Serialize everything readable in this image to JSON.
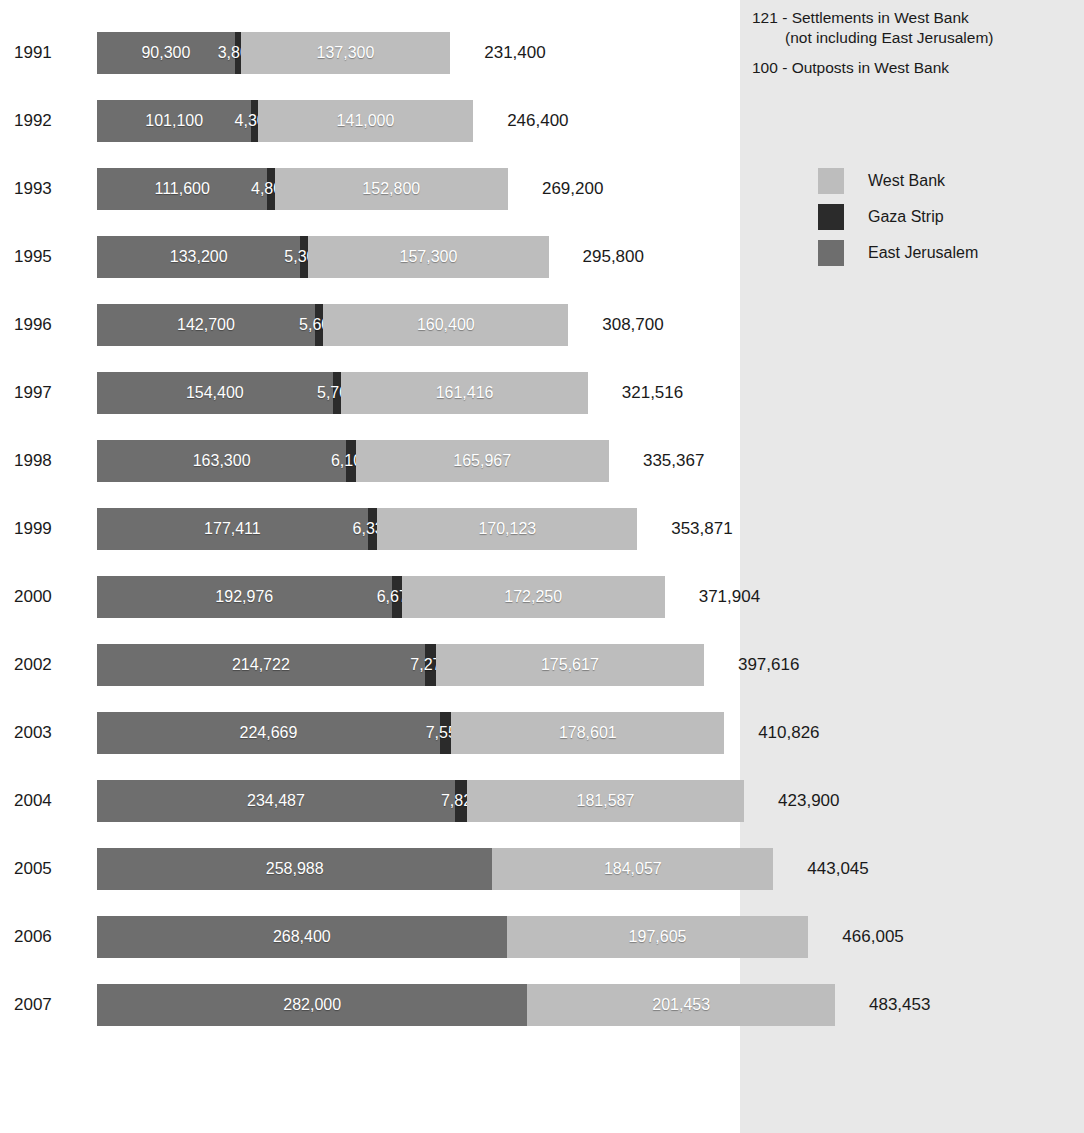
{
  "notes": {
    "line1": "121 - Settlements in West Bank",
    "line2": "(not including East Jerusalem)",
    "line3": "100 - Outposts in West Bank"
  },
  "legend": {
    "items": [
      {
        "label": "West Bank",
        "color": "#bdbdbd",
        "key": "west_bank"
      },
      {
        "label": "Gaza Strip",
        "color": "#2b2b2b",
        "key": "gaza_strip"
      },
      {
        "label": "East Jerusalem",
        "color": "#6e6e6e",
        "key": "east_jerusalem"
      }
    ]
  },
  "chart_data": {
    "type": "bar",
    "title": "",
    "subtitle": "",
    "xlabel": "",
    "ylabel": "",
    "orientation": "horizontal",
    "stacked": true,
    "grid": false,
    "legend_position": "right",
    "axis_visible": false,
    "xlim": [
      0,
      483453
    ],
    "categories": [
      "1991",
      "1992",
      "1993",
      "1995",
      "1996",
      "1997",
      "1998",
      "1999",
      "2000",
      "2002",
      "2003",
      "2004",
      "2005",
      "2006",
      "2007"
    ],
    "series": [
      {
        "name": "East Jerusalem",
        "color": "#6e6e6e",
        "values": [
          90300,
          101100,
          111600,
          133200,
          142700,
          154400,
          163300,
          177411,
          192976,
          214722,
          224669,
          234487,
          258988,
          268400,
          282000
        ],
        "labels": [
          "90,300",
          "101,100",
          "111,600",
          "133,200",
          "142,700",
          "154,400",
          "163,300",
          "177,411",
          "192,976",
          "214,722",
          "224,669",
          "234,487",
          "258,988",
          "268,400",
          "282,000"
        ]
      },
      {
        "name": "Gaza Strip",
        "color": "#2b2b2b",
        "values": [
          3800,
          4300,
          4800,
          5300,
          5600,
          5700,
          6100,
          6337,
          6678,
          7277,
          7556,
          7826,
          null,
          null,
          null
        ],
        "labels": [
          "3,800",
          "4,300",
          "4,800",
          "5,300",
          "5,600",
          "5,700",
          "6,100",
          "6,337",
          "6,678",
          "7,277",
          "7,556",
          "7,826",
          "",
          "",
          ""
        ]
      },
      {
        "name": "West Bank",
        "color": "#bdbdbd",
        "values": [
          137300,
          141000,
          152800,
          157300,
          160400,
          161416,
          165967,
          170123,
          172250,
          175617,
          178601,
          181587,
          184057,
          197605,
          201453
        ],
        "labels": [
          "137,300",
          "141,000",
          "152,800",
          "157,300",
          "160,400",
          "161,416",
          "165,967",
          "170,123",
          "172,250",
          "175,617",
          "178,601",
          "181,587",
          "184,057",
          "197,605",
          "201,453"
        ]
      }
    ],
    "totals": [
      231400,
      246400,
      269200,
      295800,
      308700,
      321516,
      335367,
      353871,
      371904,
      397616,
      410826,
      423900,
      443045,
      466005,
      483453
    ],
    "total_labels": [
      "231,400",
      "246,400",
      "269,200",
      "295,800",
      "308,700",
      "321,516",
      "335,367",
      "353,871",
      "371,904",
      "397,616",
      "410,826",
      "423,900",
      "443,045",
      "466,005",
      "483,453"
    ]
  },
  "layout": {
    "bar_left_px": 97,
    "row_height_px": 68,
    "first_row_top_px": 32,
    "bar_height_px": 42,
    "px_per_unit": 0.0015265,
    "total_label_gap_px": 34,
    "panel_left_px": 740,
    "panel_color": "#e8e8e8",
    "background_color": "#ffffff"
  }
}
